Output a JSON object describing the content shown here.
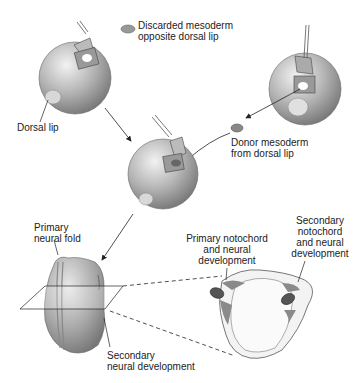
{
  "diagram": {
    "labels": {
      "discarded_line1": "Discarded mesoderm",
      "discarded_line2": "opposite dorsal lip",
      "dorsal_lip": "Dorsal lip",
      "donor_line1": "Donor mesoderm",
      "donor_line2": "from dorsal lip",
      "primary_fold_line1": "Primary",
      "primary_fold_line2": "neural fold",
      "secondary_neural_line1": "Secondary",
      "secondary_neural_line2": "neural development",
      "primary_noto_line1": "Primary notochord",
      "primary_noto_line2": "and neural",
      "primary_noto_line3": "development",
      "secondary_noto_line1": "Secondary",
      "secondary_noto_line2": "notochord",
      "secondary_noto_line3": "and neural",
      "secondary_noto_line4": "development"
    },
    "colors": {
      "embryo_light": "#e6e6e6",
      "embryo_dark": "#8a8a8a",
      "tissue_dark": "#6e6e6e",
      "line": "#222222"
    }
  }
}
